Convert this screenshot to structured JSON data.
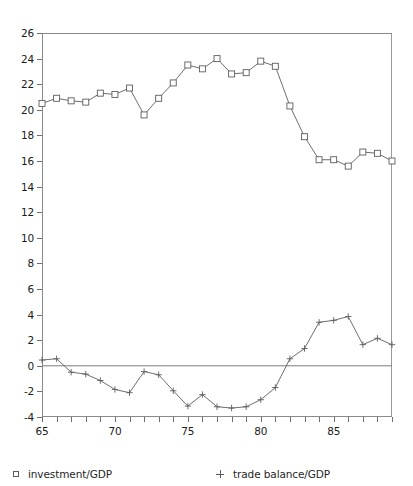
{
  "chart_data": {
    "type": "line",
    "title": "",
    "subtitle": "",
    "xlabel": "",
    "ylabel": "",
    "xlim": [
      65,
      89
    ],
    "ylim": [
      -4,
      26
    ],
    "yticks": [
      -4,
      -2,
      0,
      2,
      4,
      6,
      8,
      10,
      12,
      14,
      16,
      18,
      20,
      22,
      24,
      26
    ],
    "ytick_labels": [
      "-4",
      "-2",
      "0",
      "2",
      "4",
      "6",
      "8",
      "10",
      "12",
      "14",
      "16",
      "18",
      "20",
      "22",
      "24",
      "26"
    ],
    "xticks": [
      65,
      66,
      67,
      68,
      69,
      70,
      71,
      72,
      73,
      74,
      75,
      76,
      77,
      78,
      79,
      80,
      81,
      82,
      83,
      84,
      85,
      86,
      87,
      88,
      89
    ],
    "xtick_labels_shown": [
      "65",
      "70",
      "75",
      "80",
      "85"
    ],
    "xtick_labels_shown_at": [
      65,
      70,
      75,
      80,
      85
    ],
    "grid": false,
    "zero_line": true,
    "legend_position": "below",
    "x": [
      65,
      66,
      67,
      68,
      69,
      70,
      71,
      72,
      73,
      74,
      75,
      76,
      77,
      78,
      79,
      80,
      81,
      82,
      83,
      84,
      85,
      86,
      87,
      88,
      89
    ],
    "series": [
      {
        "name": "investment/GDP",
        "marker": "square",
        "color": "#5d5d5d",
        "values": [
          20.5,
          20.9,
          20.7,
          20.6,
          21.3,
          21.2,
          21.7,
          19.6,
          20.9,
          22.1,
          23.5,
          23.2,
          24.0,
          22.8,
          22.9,
          23.8,
          23.4,
          20.3,
          17.9,
          16.1,
          16.1,
          15.6,
          16.7,
          16.6,
          16.0
        ]
      },
      {
        "name": "trade balance/GDP",
        "marker": "plus",
        "color": "#5d5d5d",
        "values": [
          0.45,
          0.55,
          -0.5,
          -0.65,
          -1.15,
          -1.85,
          -2.1,
          -0.45,
          -0.7,
          -1.95,
          -3.15,
          -2.25,
          -3.2,
          -3.3,
          -3.2,
          -2.65,
          -1.7,
          0.55,
          1.35,
          3.4,
          3.55,
          3.85,
          1.65,
          2.15,
          1.65
        ]
      }
    ]
  },
  "legend": {
    "investment": {
      "label": "investment/GDP",
      "marker": "square-marker"
    },
    "trade": {
      "label": "trade balance/GDP",
      "marker": "plus-marker"
    }
  }
}
